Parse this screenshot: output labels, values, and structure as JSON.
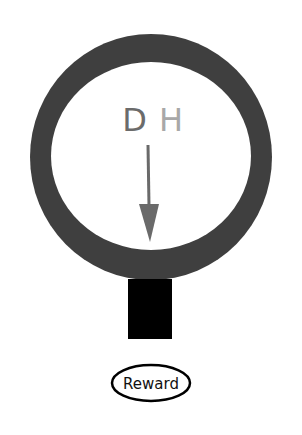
{
  "diagram": {
    "ring": {
      "outer_color": "#3f3f3f",
      "inner_color": "#ffffff"
    },
    "letters": [
      {
        "text": "D",
        "color": "#6b6b6b"
      },
      {
        "text": "H",
        "color": "#a8a8a8"
      }
    ],
    "arrow": {
      "color": "#6a6a6a",
      "direction": "down"
    },
    "stem": {
      "color": "#000000"
    },
    "reward": {
      "label": "Reward"
    }
  }
}
